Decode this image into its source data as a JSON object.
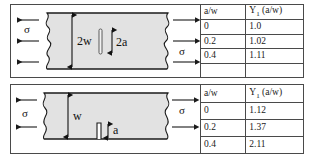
{
  "figure": {
    "panels": [
      {
        "id": "center-crack",
        "diagram": {
          "plate_label_width": "2w",
          "crack_label": "2a",
          "stress_label_left": "σ",
          "stress_label_right": "σ",
          "arrow_count_left": 3,
          "arrow_count_right": 3,
          "crack_type": "center-crack",
          "plate_fill": "#e2e2e2",
          "line_color": "#1a1a1a"
        },
        "table": {
          "headers": [
            "a/w",
            "Y₁ (a/w)"
          ],
          "header_col2_base": "Y",
          "header_col2_sub": "1",
          "header_col2_tail": " (a/w)",
          "rows": [
            [
              "0",
              "1.0"
            ],
            [
              "0.2",
              "1.02"
            ],
            [
              "0.4",
              "1.11"
            ]
          ]
        }
      },
      {
        "id": "edge-crack",
        "diagram": {
          "plate_label_width": "w",
          "crack_label": "a",
          "stress_label_left": "σ",
          "stress_label_right": "σ",
          "arrow_count_left": 2,
          "arrow_count_right": 2,
          "crack_type": "edge-crack",
          "plate_fill": "#e2e2e2",
          "line_color": "#1a1a1a"
        },
        "table": {
          "headers": [
            "a/w",
            "Y₁ (a/w)"
          ],
          "header_col2_base": "Y",
          "header_col2_sub": "1",
          "header_col2_tail": " (a/w)",
          "rows": [
            [
              "0",
              "1.12"
            ],
            [
              "0.2",
              "1.37"
            ],
            [
              "0.4",
              "2.11"
            ]
          ]
        }
      }
    ]
  }
}
